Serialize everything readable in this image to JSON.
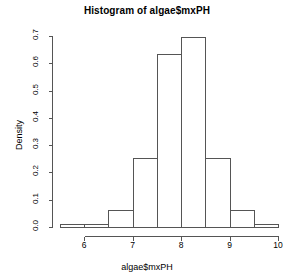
{
  "chart_data": {
    "type": "bar",
    "subtype": "histogram",
    "title": "Histogram of algae$mxPH",
    "xlabel": "algae$mxPH",
    "ylabel": "Density",
    "xlim": [
      5.5,
      10.0
    ],
    "ylim": [
      0.0,
      0.7
    ],
    "grid": false,
    "legend": null,
    "bin_width": 0.5,
    "breaks": [
      5.5,
      6.0,
      6.5,
      7.0,
      7.5,
      8.0,
      8.5,
      9.0,
      9.5,
      10.0
    ],
    "categories": [
      "5.5-6.0",
      "6.0-6.5",
      "6.5-7.0",
      "7.0-7.5",
      "7.5-8.0",
      "8.0-8.5",
      "8.5-9.0",
      "9.0-9.5",
      "9.5-10.0"
    ],
    "values": [
      0.012,
      0.012,
      0.063,
      0.253,
      0.635,
      0.698,
      0.254,
      0.063,
      0.01
    ],
    "bins": [
      {
        "from": 5.5,
        "to": 6.0,
        "density": 0.012
      },
      {
        "from": 6.0,
        "to": 6.5,
        "density": 0.012
      },
      {
        "from": 6.5,
        "to": 7.0,
        "density": 0.063
      },
      {
        "from": 7.0,
        "to": 7.5,
        "density": 0.253
      },
      {
        "from": 7.5,
        "to": 8.0,
        "density": 0.635
      },
      {
        "from": 8.0,
        "to": 8.5,
        "density": 0.698
      },
      {
        "from": 8.5,
        "to": 9.0,
        "density": 0.254
      },
      {
        "from": 9.0,
        "to": 9.5,
        "density": 0.063
      },
      {
        "from": 9.5,
        "to": 10.0,
        "density": 0.01
      }
    ],
    "xticks": [
      6,
      7,
      8,
      9,
      10
    ],
    "xtick_labels": [
      "6",
      "7",
      "8",
      "9",
      "10"
    ],
    "yticks": [
      0.0,
      0.1,
      0.2,
      0.3,
      0.4,
      0.5,
      0.6,
      0.7
    ],
    "ytick_labels": [
      "0.0",
      "0.1",
      "0.2",
      "0.3",
      "0.4",
      "0.5",
      "0.6",
      "0.7"
    ],
    "colors": {
      "background": "#ffffff",
      "axis": "#555555",
      "bar_stroke": "#555555",
      "bar_fill": "none",
      "text": "#000000"
    }
  }
}
